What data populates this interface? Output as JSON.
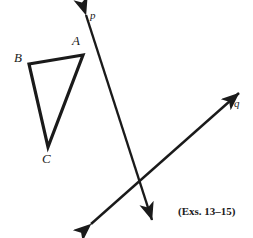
{
  "figure": {
    "width": 253,
    "height": 238,
    "background_color": "#ffffff",
    "ink_color": "#1a1a1a",
    "caption": "(Exs. 13–15)",
    "caption_position": {
      "x": 178,
      "y": 206
    },
    "triangle": {
      "name": "triangle-abc",
      "stroke_width": 3.2,
      "vertices": [
        {
          "label": "A",
          "x": 83,
          "y": 55,
          "label_x": 72,
          "label_y": 34
        },
        {
          "label": "B",
          "x": 29,
          "y": 64,
          "label_x": 14,
          "label_y": 51
        },
        {
          "label": "C",
          "x": 48,
          "y": 147,
          "label_x": 42,
          "label_y": 152
        }
      ],
      "path": "M 83 55 L 29 64 L 48 147 Z"
    },
    "lines": [
      {
        "label": "p",
        "name": "line-p",
        "stroke_width": 2.4,
        "x1": 86,
        "y1": 15,
        "x2": 152,
        "y2": 220,
        "arrow_start": true,
        "arrow_end": true,
        "label_x": 90,
        "label_y": 10
      },
      {
        "label": "q",
        "name": "line-q",
        "stroke_width": 2.4,
        "x1": 91,
        "y1": 224,
        "x2": 239,
        "y2": 93,
        "arrow_start": true,
        "arrow_end": true,
        "label_x": 234,
        "label_y": 98
      }
    ],
    "intersection": {
      "x": 139,
      "y": 184
    }
  }
}
